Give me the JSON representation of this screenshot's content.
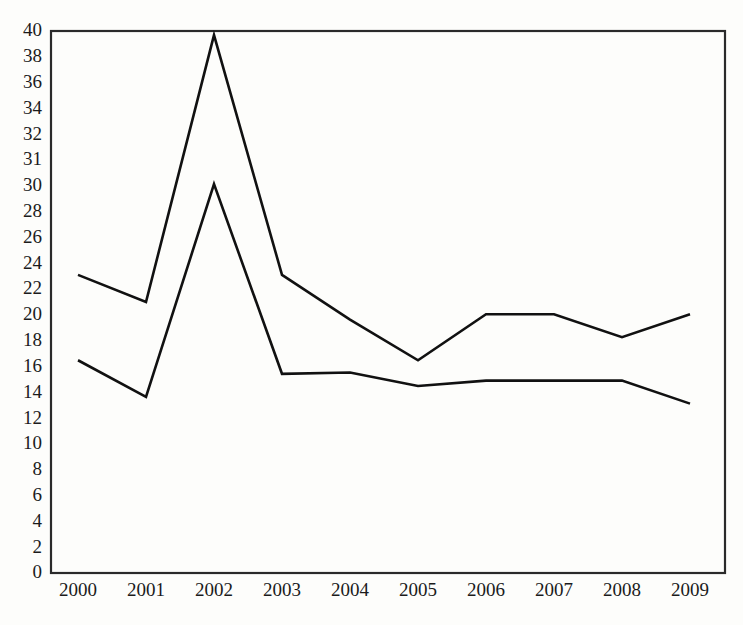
{
  "chart_data": {
    "type": "line",
    "title": "",
    "subtitle": "",
    "xlabel": "",
    "ylabel": "",
    "grid": false,
    "legend_position": "none",
    "x": [
      "2000",
      "2001",
      "2002",
      "2003",
      "2004",
      "2005",
      "2006",
      "2007",
      "2008",
      "2009"
    ],
    "categories": [
      "2000",
      "2001",
      "2002",
      "2003",
      "2004",
      "2005",
      "2006",
      "2007",
      "2008",
      "2009"
    ],
    "xlim": [
      "2000",
      "2009"
    ],
    "ylim": [
      0,
      40
    ],
    "ytick_labels": [
      "40",
      "38",
      "36",
      "34",
      "32",
      "31",
      "30",
      "28",
      "26",
      "24",
      "22",
      "20",
      "18",
      "16",
      "14",
      "12",
      "10",
      "8",
      "6",
      "4",
      "2",
      "0"
    ],
    "ytick_values": [
      40,
      38,
      36,
      34,
      32,
      31,
      30,
      28,
      26,
      24,
      22,
      20,
      18,
      16,
      14,
      12,
      10,
      8,
      6,
      4,
      2,
      0
    ],
    "xtick_labels": [
      "2000",
      "2001",
      "2002",
      "2003",
      "2004",
      "2005",
      "2006",
      "2007",
      "2008",
      "2009"
    ],
    "series": [
      {
        "name": "upper-series",
        "color": "#111111",
        "values": [
          22.0,
          20.0,
          39.7,
          22.0,
          18.7,
          15.7,
          19.1,
          19.1,
          17.4,
          19.1
        ]
      },
      {
        "name": "lower-series",
        "color": "#111111",
        "values": [
          15.7,
          13.0,
          28.7,
          14.7,
          14.8,
          13.8,
          14.2,
          14.2,
          14.2,
          12.5
        ]
      }
    ],
    "annotations": []
  },
  "axes": {
    "y_axis_name": "y-axis",
    "x_axis_name": "x-axis"
  }
}
